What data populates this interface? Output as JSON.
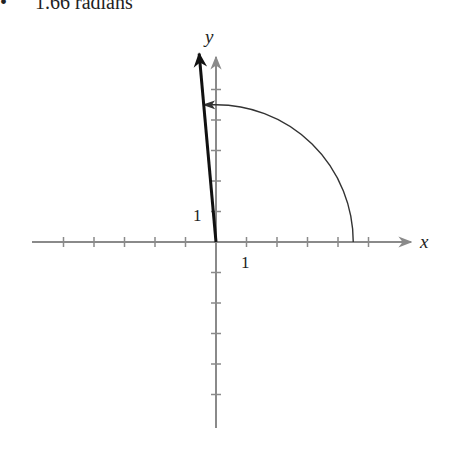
{
  "caption": {
    "bullet": "•",
    "text": "1.66 radians"
  },
  "axes": {
    "x_label": "x",
    "y_label": "y",
    "x_unit_label": "1",
    "y_unit_label": "1",
    "origin_px": [
      216,
      242
    ],
    "tick_spacing_px": 30.5,
    "x_ticks": [
      -5,
      -4,
      -3,
      -2,
      -1,
      1,
      2,
      3,
      4,
      5
    ],
    "y_ticks_up": [
      1,
      2,
      3,
      4,
      5
    ],
    "y_ticks_down": [
      -1,
      -2,
      -3,
      -4,
      -5
    ],
    "axis_color": "#8a8a8a"
  },
  "angle": {
    "radians": 1.66,
    "arc_radius_units": 4.5,
    "vector_length_units": 6.2,
    "vector_color": "#111111",
    "arc_color": "#333333"
  }
}
